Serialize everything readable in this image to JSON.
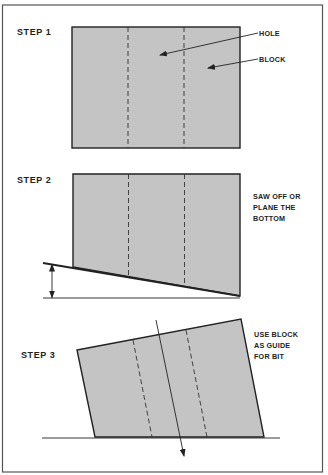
{
  "colors": {
    "block_fill": "#c4c4c4",
    "stroke": "#222222",
    "frame": "#555555",
    "background": "#ffffff"
  },
  "steps": [
    {
      "label": "STEP 1",
      "callouts": [
        {
          "text": "HOLE"
        },
        {
          "text": "BLOCK"
        }
      ]
    },
    {
      "label": "STEP 2",
      "note_lines": [
        "SAW OFF OR",
        "PLANE THE",
        "BOTTOM"
      ]
    },
    {
      "label": "STEP 3",
      "note_lines": [
        "USE BLOCK",
        "AS GUIDE",
        "FOR BIT"
      ]
    }
  ]
}
